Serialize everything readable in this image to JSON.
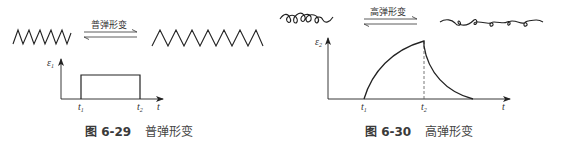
{
  "figures": [
    {
      "id": "6-29",
      "caption_number": "图 6-29",
      "caption_text": "普弹形变",
      "arrow_label": "普弹形变",
      "y_axis_label": "ε",
      "y_axis_sub": "1",
      "x_axis_label": "t",
      "t1_label": "t",
      "t1_sub": "1",
      "t2_label": "t",
      "t2_sub": "2",
      "molecule_before": "compressed-zigzag-chain",
      "molecule_after": "stretched-zigzag-chain",
      "curve_shape": "rectangular-step"
    },
    {
      "id": "6-30",
      "caption_number": "图 6-30",
      "caption_text": "高弹形变",
      "arrow_label": "高弹形变",
      "y_axis_label": "ε",
      "y_axis_sub": "2",
      "x_axis_label": "t",
      "t1_label": "t",
      "t1_sub": "1",
      "t2_label": "t",
      "t2_sub": "2",
      "molecule_before": "coiled-chain",
      "molecule_after": "extended-coiled-chain",
      "curve_shape": "rise-then-decay"
    }
  ],
  "colors": {
    "line": "#222222",
    "text": "#333333",
    "background": "#ffffff"
  }
}
